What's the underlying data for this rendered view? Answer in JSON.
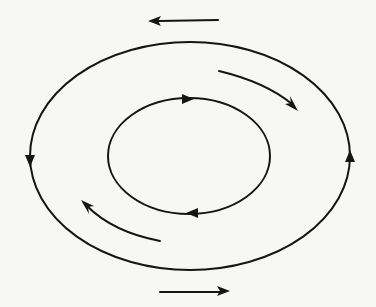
{
  "diagram": {
    "type": "circulation-flow",
    "elements": [
      {
        "name": "outer-loop",
        "shape": "ellipse",
        "direction": "counterclockwise-on-screen: down on left, up on right"
      },
      {
        "name": "inner-loop",
        "shape": "ellipse",
        "direction": "right along top, left along bottom"
      },
      {
        "name": "top-flow-arrow",
        "shape": "straight-arrow",
        "direction": "left"
      },
      {
        "name": "bottom-flow-arrow",
        "shape": "straight-arrow",
        "direction": "right"
      },
      {
        "name": "upper-right-curved-arrow",
        "shape": "curved-arrow",
        "direction": "down-right"
      },
      {
        "name": "lower-left-curved-arrow",
        "shape": "curved-arrow",
        "direction": "up-left"
      }
    ],
    "colors": {
      "line": "#151515",
      "background": "#f7f7f5"
    }
  }
}
